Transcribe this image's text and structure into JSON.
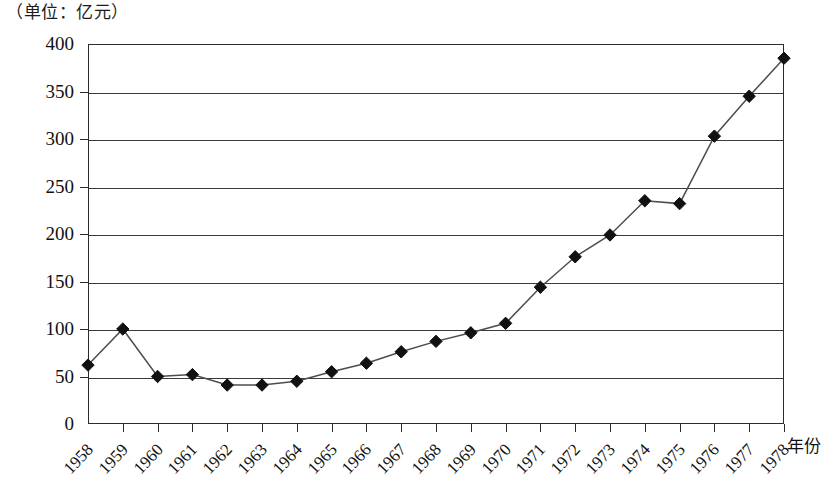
{
  "caption": "（单位：亿元）",
  "axis": {
    "x_title": "年份",
    "y_ticks": [
      "0",
      "50",
      "100",
      "150",
      "200",
      "250",
      "300",
      "350",
      "400"
    ]
  },
  "chart_data": {
    "type": "line",
    "title": "",
    "subtitle": "",
    "unit_caption": "（单位：亿元）",
    "xlabel": "年份",
    "ylabel": "",
    "ylim": [
      0,
      400
    ],
    "ytick_step": 50,
    "grid": true,
    "legend": "none",
    "marker": "diamond",
    "marker_color": "#111111",
    "line_color": "#4d4d4d",
    "categories": [
      "1958",
      "1959",
      "1960",
      "1961",
      "1962",
      "1963",
      "1964",
      "1965",
      "1966",
      "1967",
      "1968",
      "1969",
      "1970",
      "1971",
      "1972",
      "1973",
      "1974",
      "1975",
      "1976",
      "1977",
      "1978"
    ],
    "values": [
      62,
      100,
      50,
      52,
      41,
      41,
      45,
      55,
      64,
      76,
      87,
      96,
      106,
      144,
      176,
      199,
      235,
      232,
      303,
      345,
      385
    ]
  }
}
